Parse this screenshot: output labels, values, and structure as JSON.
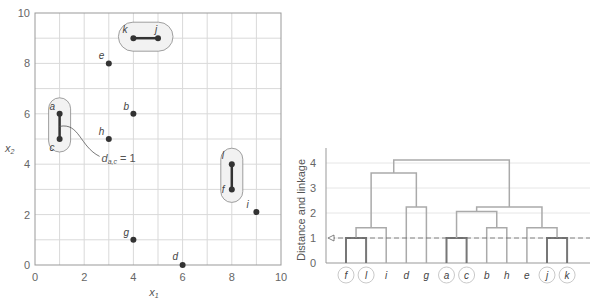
{
  "chart_data": [
    {
      "type": "scatter",
      "title": "",
      "xlabel": "x1",
      "ylabel": "x2",
      "xlim": [
        0,
        10
      ],
      "ylim": [
        0,
        10
      ],
      "xticks": [
        0,
        2,
        4,
        6,
        8,
        10
      ],
      "yticks": [
        0,
        2,
        4,
        6,
        8,
        10
      ],
      "grid": true,
      "points": [
        {
          "label": "a",
          "x": 1,
          "y": 6
        },
        {
          "label": "b",
          "x": 4,
          "y": 6
        },
        {
          "label": "c",
          "x": 1,
          "y": 5
        },
        {
          "label": "d",
          "x": 6,
          "y": 0
        },
        {
          "label": "e",
          "x": 3,
          "y": 8
        },
        {
          "label": "f",
          "x": 8,
          "y": 3
        },
        {
          "label": "g",
          "x": 4,
          "y": 1
        },
        {
          "label": "h",
          "x": 3,
          "y": 5
        },
        {
          "label": "i",
          "x": 9,
          "y": 2.1
        },
        {
          "label": "j",
          "x": 5,
          "y": 9
        },
        {
          "label": "k",
          "x": 4,
          "y": 9
        },
        {
          "label": "l",
          "x": 8,
          "y": 4
        }
      ],
      "highlighted_pairs": [
        [
          "a",
          "c"
        ],
        [
          "k",
          "j"
        ],
        [
          "l",
          "f"
        ]
      ],
      "annotation": "d_a,c = 1"
    },
    {
      "type": "dendrogram",
      "ylabel": "Distance and linkage",
      "ylim": [
        0,
        4.5
      ],
      "yticks": [
        0,
        1,
        2,
        3,
        4
      ],
      "leaf_order": [
        "f",
        "l",
        "i",
        "d",
        "g",
        "a",
        "c",
        "b",
        "h",
        "e",
        "j",
        "k"
      ],
      "circled_leaves": [
        "f",
        "l",
        "a",
        "c",
        "j",
        "k"
      ],
      "cut_line": 1,
      "merges": [
        {
          "left": "f",
          "right": "l",
          "height": 1.0
        },
        {
          "left": "a",
          "right": "c",
          "height": 1.0
        },
        {
          "left": "j",
          "right": "k",
          "height": 1.0
        },
        {
          "left": "fl",
          "right": "i",
          "height": 1.41
        },
        {
          "left": "b",
          "right": "h",
          "height": 1.41
        },
        {
          "left": "e",
          "right": "jk",
          "height": 1.41
        },
        {
          "left": "ac",
          "right": "bh",
          "height": 2.06
        },
        {
          "left": "d",
          "right": "g",
          "height": 2.24
        },
        {
          "left": "acbh",
          "right": "ejk",
          "height": 2.24
        },
        {
          "left": "fli",
          "right": "dg",
          "height": 3.6
        },
        {
          "left": "flidg",
          "right": "acbhejk",
          "height": 4.12
        }
      ]
    }
  ],
  "labels": {
    "scatter_xlabel": "x",
    "scatter_xlabel_sub": "1",
    "scatter_ylabel": "x",
    "scatter_ylabel_sub": "2",
    "annotation_main": "d",
    "annotation_sub": "a,c",
    "annotation_eq": " = 1",
    "dendro_ylabel": "Distance and linkage"
  },
  "colors": {
    "grid": "#d9d9d9",
    "axis": "#999999",
    "point": "#333333",
    "link_thick": "#333333",
    "pill_fill": "#f2f2f2",
    "pill_stroke": "#888888",
    "dendro_line": "#aaaaaa",
    "dendro_strong": "#777777",
    "cut_line": "#666666"
  }
}
